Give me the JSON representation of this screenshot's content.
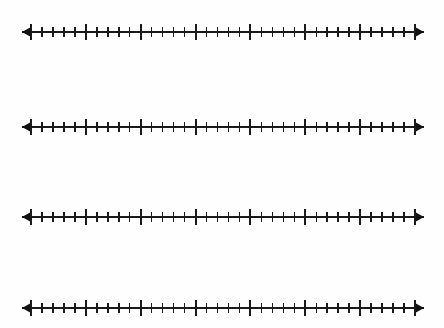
{
  "page": {
    "background_color": "#fefefe",
    "ink_color": "#1a1a1a",
    "width": 444,
    "height": 328,
    "labels": []
  },
  "chart_data": {
    "type": "number-line",
    "title": "",
    "xlabel": "",
    "ylabel": "",
    "grid": false,
    "legend": null,
    "tick_labels": [],
    "data_points": [],
    "geometry": {
      "axis_x_start": 22,
      "axis_x_end": 424,
      "first_major_x": 31,
      "last_major_x": 415,
      "major_count": 8,
      "major_spacing_px": 54.86,
      "minor_per_interval": 4,
      "minor_spacing_px": 10.97,
      "major_tick_height_px": 16,
      "minor_tick_height_px": 10,
      "arrow_length_px": 9,
      "arrow_half_height_px": 5
    },
    "lines": [
      {
        "id": "number-line-1",
        "index": 1,
        "axis_y": 32,
        "marks": []
      },
      {
        "id": "number-line-2",
        "index": 2,
        "axis_y": 127,
        "marks": []
      },
      {
        "id": "number-line-3",
        "index": 3,
        "axis_y": 217,
        "marks": []
      },
      {
        "id": "number-line-4",
        "index": 4,
        "axis_y": 308,
        "marks": []
      }
    ]
  }
}
